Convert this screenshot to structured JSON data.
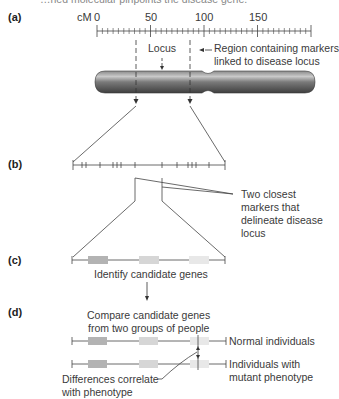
{
  "caption_fragment": "…ned molecular pinpoints the disease gene.",
  "panels": {
    "a": {
      "label": "(a)",
      "scale_unit": "cM",
      "ticks": [
        "0",
        "50",
        "100",
        "150"
      ],
      "locus_label": "Locus",
      "region_label_line1": "Region containing markers",
      "region_label_line2": "linked to disease locus"
    },
    "b": {
      "label": "(b)",
      "annotation_line1": "Two closest",
      "annotation_line2": "markers that",
      "annotation_line3": "delineate disease",
      "annotation_line4": "locus"
    },
    "c": {
      "label": "(c)",
      "caption": "Identify candidate genes"
    },
    "d": {
      "label": "(d)",
      "caption_line1": "Compare candidate genes",
      "caption_line2": "from two groups of people",
      "normal_label": "Normal individuals",
      "mutant_label_line1": "Individuals with",
      "mutant_label_line2": "mutant phenotype",
      "difference_line1": "Differences correlate",
      "difference_line2": "with phenotype"
    }
  },
  "colors": {
    "line": "#444444",
    "chromosome_dark": "#555555",
    "chromosome_light": "#bdbdbd",
    "gene_dark": "#b3b3b3",
    "gene_mid": "#d6d6d6",
    "gene_light": "#e8e8e8"
  }
}
